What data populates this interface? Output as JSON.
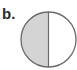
{
  "figure": {
    "label": "b.",
    "shape": "circle",
    "parts_total": 2,
    "parts_shaded": 1,
    "shaded_side": "left",
    "colors": {
      "shade": "#d4d4d4",
      "outline": "#6a6a6a",
      "background": "#ffffff"
    }
  }
}
